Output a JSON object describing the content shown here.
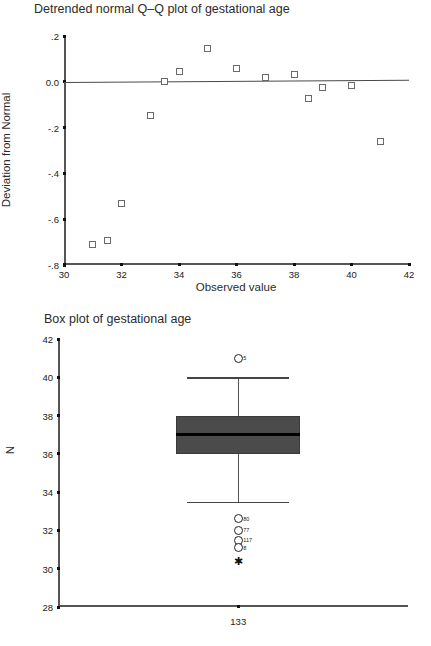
{
  "chart_data": [
    {
      "type": "scatter",
      "title": "Detrended normal Q–Q plot of gestational age",
      "xlabel": "Observed value",
      "ylabel": "Deviation from Normal",
      "xlim": [
        30,
        42
      ],
      "ylim": [
        -0.8,
        0.2
      ],
      "xticks": [
        30,
        32,
        34,
        36,
        38,
        40,
        42
      ],
      "xticklabels": [
        "30",
        "32",
        "34",
        "36",
        "38",
        "40",
        "42"
      ],
      "yticks": [
        0.2,
        0.0,
        -0.2,
        -0.4,
        -0.6,
        -0.8
      ],
      "yticklabels": [
        ".2",
        "0.0",
        "-.2",
        "-.4",
        "-.6",
        "-.8"
      ],
      "grid": false,
      "legend": "none",
      "marker": "open-square",
      "reference_line": {
        "y_left": 0.0,
        "y_right": 0.01,
        "label": "zero-deviation-line"
      },
      "points": [
        {
          "x": 31.0,
          "y": -0.712
        },
        {
          "x": 31.5,
          "y": -0.695
        },
        {
          "x": 32.0,
          "y": -0.532
        },
        {
          "x": 33.0,
          "y": -0.148
        },
        {
          "x": 33.5,
          "y": 0.003
        },
        {
          "x": 34.0,
          "y": 0.047
        },
        {
          "x": 35.0,
          "y": 0.145
        },
        {
          "x": 36.0,
          "y": 0.058
        },
        {
          "x": 37.0,
          "y": 0.017
        },
        {
          "x": 38.0,
          "y": 0.03
        },
        {
          "x": 38.5,
          "y": -0.075
        },
        {
          "x": 39.0,
          "y": -0.023
        },
        {
          "x": 40.0,
          "y": -0.014
        },
        {
          "x": 41.0,
          "y": -0.262
        }
      ]
    },
    {
      "type": "box",
      "title": "Box plot of gestational age",
      "xlabel": "",
      "ylabel": "N",
      "ylim": [
        28,
        42
      ],
      "yticks": [
        42,
        40,
        38,
        36,
        34,
        32,
        30,
        28
      ],
      "yticklabels": [
        "42",
        "40",
        "38",
        "36",
        "34",
        "32",
        "30",
        "28"
      ],
      "grid": false,
      "legend": "none",
      "category_label": "133",
      "box": {
        "q1": 36.0,
        "median": 37.0,
        "q3": 38.0,
        "whisker_low": 33.5,
        "whisker_high": 40.0,
        "box_color": "#4b4b4b",
        "median_color": "#000000"
      },
      "outliers": [
        {
          "value": 41.0,
          "label": "5",
          "kind": "mild"
        },
        {
          "value": 32.6,
          "label": "80",
          "kind": "mild"
        },
        {
          "value": 32.0,
          "label": "77",
          "kind": "mild"
        },
        {
          "value": 31.5,
          "label": "117",
          "kind": "mild"
        },
        {
          "value": 31.1,
          "label": "8",
          "kind": "mild"
        },
        {
          "value": 30.4,
          "label": "",
          "kind": "extreme"
        }
      ]
    }
  ],
  "qq": {
    "title": "Detrended normal Q–Q plot of gestational age",
    "xlabel": "Observed value",
    "ylabel": "Deviation from Normal"
  },
  "box": {
    "title": "Box plot of gestational age",
    "ylabel": "N",
    "category_label": "133"
  }
}
